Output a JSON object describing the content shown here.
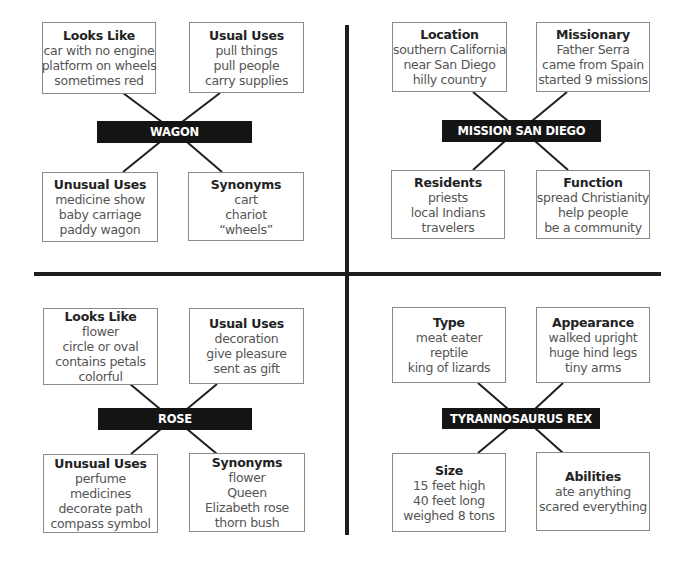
{
  "diagrams": [
    {
      "center_label": "WAGON",
      "boxes": [
        {
          "title": "Looks Like",
          "lines": [
            "car with no engine",
            "platform on wheels",
            "sometimes red"
          ]
        },
        {
          "title": "Usual Uses",
          "lines": [
            "pull things",
            "pull people",
            "carry supplies"
          ]
        },
        {
          "title": "Unusual Uses",
          "lines": [
            "medicine show",
            "baby carriage",
            "paddy wagon"
          ]
        },
        {
          "title": "Synonyms",
          "lines": [
            "cart",
            "chariot",
            "“wheels”"
          ]
        }
      ]
    },
    {
      "center_label": "MISSION SAN DIEGO",
      "boxes": [
        {
          "title": "Location",
          "lines": [
            "southern California",
            "near San Diego",
            "hilly country"
          ]
        },
        {
          "title": "Missionary",
          "lines": [
            "Father Serra",
            "came from Spain",
            "started 9 missions"
          ]
        },
        {
          "title": "Residents",
          "lines": [
            "priests",
            "local Indians",
            "travelers"
          ]
        },
        {
          "title": "Function",
          "lines": [
            "spread Christianity",
            "help people",
            "be a community"
          ]
        }
      ]
    },
    {
      "center_label": "ROSE",
      "boxes": [
        {
          "title": "Looks Like",
          "lines": [
            "flower",
            "circle or oval",
            "contains petals",
            "colorful"
          ]
        },
        {
          "title": "Usual Uses",
          "lines": [
            "decoration",
            "give pleasure",
            "sent as gift"
          ]
        },
        {
          "title": "Unusual Uses",
          "lines": [
            "perfume",
            "medicines",
            "decorate path",
            "compass symbol"
          ]
        },
        {
          "title": "Synonyms",
          "lines": [
            "flower",
            "Queen",
            "Elizabeth rose",
            "thorn bush"
          ]
        }
      ]
    },
    {
      "center_label": "TYRANNOSAURUS REX",
      "boxes": [
        {
          "title": "Type",
          "lines": [
            "meat eater",
            "reptile",
            "king of lizards"
          ]
        },
        {
          "title": "Appearance",
          "lines": [
            "walked upright",
            "huge hind legs",
            "tiny arms"
          ]
        },
        {
          "title": "Size",
          "lines": [
            "15 feet high",
            "40 feet long",
            "weighed 8 tons"
          ]
        },
        {
          "title": "Abilities",
          "lines": [
            "ate anything",
            "scared everything"
          ]
        }
      ]
    }
  ],
  "colors": {
    "label_background": "#141414",
    "label_text": "#ffffff",
    "box_border": "#8a8a8a",
    "divider": "#1e1e1e"
  }
}
